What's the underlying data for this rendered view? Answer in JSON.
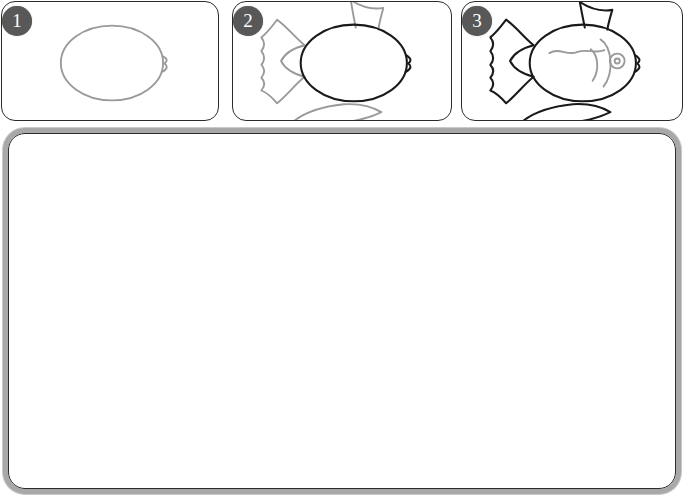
{
  "app": {
    "title": "Fish Drawing Tutorial",
    "background_color": "#ffffff"
  },
  "colors": {
    "badge_fill": "#585858",
    "badge_text": "#ffffff",
    "panel_border": "#2b2b2b",
    "canvas_border": "#a8a8a8",
    "ink_active": "#1a1a1a",
    "ink_guide": "#9a9a9a",
    "canvas_background": "#ffffff"
  },
  "steps": [
    {
      "number": "1",
      "badge_label": "1",
      "name": "step-panel-1",
      "description": "Oval body outline with small mouth notch on the right",
      "shapes_guide": [
        "body-oval",
        "mouth-notch"
      ],
      "shapes_active": []
    },
    {
      "number": "2",
      "badge_label": "2",
      "name": "step-panel-2",
      "description": "Add tail fin, dorsal fin and bottom fin to the body",
      "shapes_guide": [
        "tail-fin",
        "dorsal-fin",
        "bottom-fin"
      ],
      "shapes_active": [
        "body-oval",
        "mouth-notch"
      ]
    },
    {
      "number": "3",
      "badge_label": "3",
      "name": "step-panel-3",
      "description": "Add eye, gill curves and a wavy body line to finish the fish",
      "shapes_guide": [
        "eye",
        "gill-curves",
        "body-wave-line"
      ],
      "shapes_active": [
        "body-oval",
        "mouth-notch",
        "tail-fin",
        "dorsal-fin",
        "bottom-fin"
      ]
    }
  ],
  "canvas": {
    "name": "drawing-canvas",
    "content": "",
    "placeholder": ""
  }
}
